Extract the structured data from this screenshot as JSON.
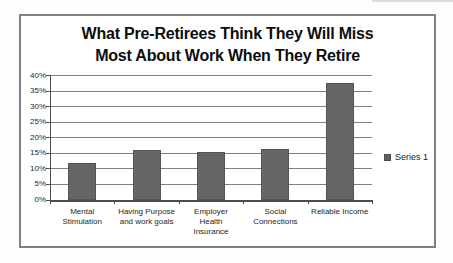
{
  "window": {
    "width": 453,
    "height": 263
  },
  "chart_data": {
    "type": "bar",
    "title": "What Pre-Retirees Think They Will Miss Most About Work When They Retire",
    "title_lines": [
      "What Pre-Retirees Think They Will Miss",
      "Most About Work When They Retire"
    ],
    "categories": [
      "Mental Stimulation",
      "Having Purpose and work goals",
      "Employer Health Insurance",
      "Social Connections",
      "Reliable Income"
    ],
    "category_label_lines": [
      [
        "Mental",
        "Stimulation"
      ],
      [
        "Having Purpose",
        "and work goals"
      ],
      [
        "Employer",
        "Health",
        "Insurance"
      ],
      [
        "Social",
        "Connections"
      ],
      [
        "Reliable Income"
      ]
    ],
    "series": [
      {
        "name": "Series 1",
        "values": [
          12,
          16,
          15.5,
          16.5,
          37.5
        ]
      }
    ],
    "xlabel": "",
    "ylabel": "",
    "ylim": [
      0,
      40
    ],
    "y_tick_step": 5,
    "y_tick_labels": [
      "0%",
      "5%",
      "10%",
      "15%",
      "20%",
      "25%",
      "30%",
      "35%",
      "40%"
    ],
    "grid": true,
    "legend_position": "right",
    "colors": {
      "bar": "#666666",
      "bar_border": "#545454",
      "gridline": "#7f7f7f",
      "axis": "#4d4d4d",
      "text": "#262626",
      "frame_border": "#808080",
      "background": "#ffffff"
    }
  }
}
